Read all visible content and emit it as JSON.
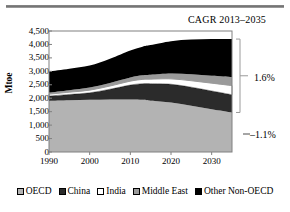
{
  "chart_data": {
    "type": "area",
    "title": "CAGR 2013–2035",
    "xlabel": "",
    "ylabel": "Mtoe",
    "stacked": true,
    "grid": false,
    "legend_position": "bottom",
    "xlim": [
      1990,
      2035
    ],
    "ylim": [
      0,
      4500
    ],
    "ytick_labels": [
      "4,500",
      "4,000",
      "3,500",
      "3,000",
      "2,500",
      "2,000",
      "1,500",
      "1,000",
      "500",
      "0"
    ],
    "ytick_values": [
      4500,
      4000,
      3500,
      3000,
      2500,
      2000,
      1500,
      1000,
      500,
      0
    ],
    "xtick_labels": [
      "1990",
      "2000",
      "2010",
      "2020",
      "2030"
    ],
    "xtick_values": [
      1990,
      2000,
      2010,
      2020,
      2030
    ],
    "x": [
      1990,
      1995,
      2000,
      2005,
      2010,
      2013,
      2015,
      2020,
      2025,
      2030,
      2035
    ],
    "series": [
      {
        "name": "OECD",
        "color": "#b3b3b3",
        "values": [
          1900,
          1920,
          1940,
          1955,
          1950,
          1940,
          1910,
          1840,
          1720,
          1590,
          1470
        ]
      },
      {
        "name": "China",
        "color": "#2b2b2b",
        "values": [
          180,
          220,
          260,
          380,
          540,
          600,
          630,
          680,
          690,
          680,
          660
        ]
      },
      {
        "name": "India",
        "color": "#ffffff",
        "values": [
          70,
          85,
          100,
          120,
          145,
          160,
          170,
          200,
          240,
          290,
          340
        ]
      },
      {
        "name": "Middle East",
        "color": "#9a9a9a",
        "values": [
          60,
          75,
          95,
          115,
          140,
          155,
          165,
          200,
          240,
          280,
          320
        ]
      },
      {
        "name": "Other Non-OECD",
        "color": "#000000",
        "values": [
          790,
          800,
          820,
          900,
          1000,
          1060,
          1100,
          1200,
          1290,
          1360,
          1410
        ]
      }
    ],
    "annotations": [
      {
        "name": "cagr-non-oecd",
        "text": "1.6%",
        "bracket": true
      },
      {
        "name": "cagr-oecd",
        "text": "–1.1%",
        "bracket": false
      }
    ]
  },
  "legend": {
    "items": [
      {
        "label": "OECD",
        "color": "#b3b3b3"
      },
      {
        "label": "China",
        "color": "#2b2b2b"
      },
      {
        "label": "India",
        "color": "#ffffff"
      },
      {
        "label": "Middle East",
        "color": "#9a9a9a"
      },
      {
        "label": "Other Non-OECD",
        "color": "#000000"
      }
    ]
  }
}
